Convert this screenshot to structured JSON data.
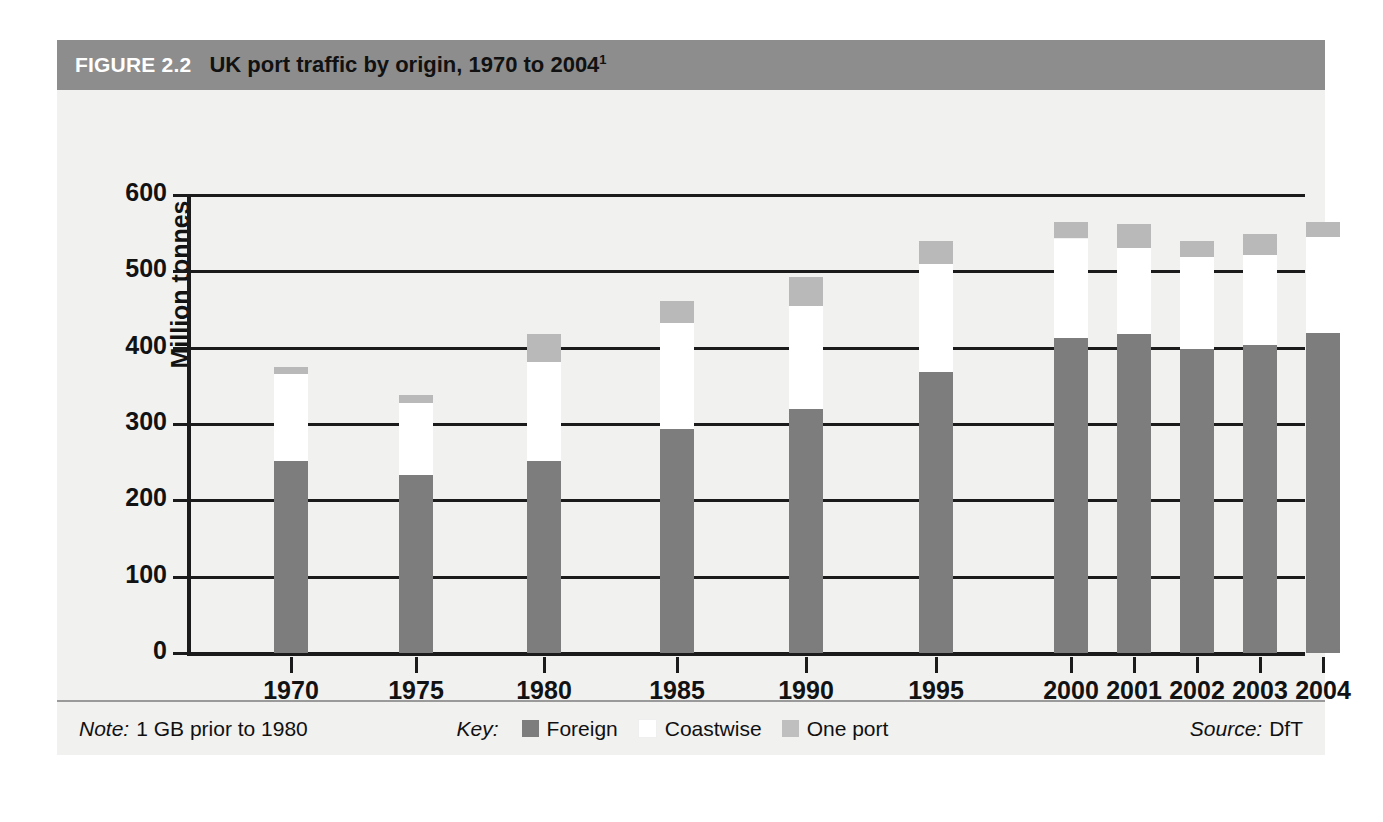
{
  "figure": {
    "number_label": "FIGURE 2.2",
    "title": "UK port traffic by origin, 1970 to 2004",
    "title_superscript": "1"
  },
  "footer": {
    "note_label": "Note:",
    "note_text": "1 GB prior to 1980",
    "key_label": "Key:",
    "source_label": "Source:",
    "source_text": "DfT"
  },
  "chart_data": {
    "type": "bar",
    "stacked": true,
    "title": "UK port traffic by origin, 1970 to 2004",
    "xlabel": "",
    "ylabel": "Million tonnes",
    "ylim": [
      0,
      600
    ],
    "yticks": [
      0,
      100,
      200,
      300,
      400,
      500,
      600
    ],
    "grid": true,
    "legend_position": "bottom",
    "categories": [
      "1970",
      "1975",
      "1980",
      "1985",
      "1990",
      "1995",
      "2000",
      "2001",
      "2002",
      "2003",
      "2004"
    ],
    "series": [
      {
        "name": "Foreign",
        "color": "#7d7d7d",
        "values": [
          252,
          233,
          252,
          294,
          320,
          368,
          413,
          418,
          398,
          403,
          419
        ]
      },
      {
        "name": "Coastwise",
        "color": "#ffffff",
        "values": [
          113,
          95,
          129,
          138,
          134,
          142,
          130,
          112,
          121,
          118,
          126
        ]
      },
      {
        "name": "One port",
        "color": "#b9b9b9",
        "values": [
          10,
          10,
          37,
          29,
          38,
          30,
          22,
          32,
          21,
          28,
          19
        ]
      }
    ],
    "totals": [
      375,
      338,
      418,
      461,
      492,
      540,
      565,
      562,
      540,
      549,
      564
    ]
  }
}
